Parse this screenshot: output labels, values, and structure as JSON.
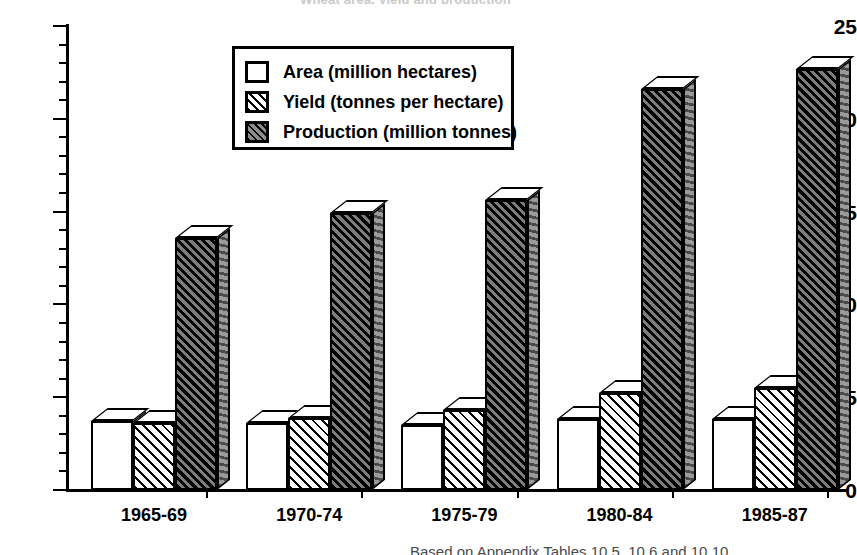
{
  "figure": {
    "title_cropped": "Wheat area, yield and production",
    "caption_cropped": "Based on Appendix Tables 10.5, 10.6 and 10.10"
  },
  "chart_data": {
    "type": "bar",
    "title": "Wheat area, yield and production",
    "xlabel": "",
    "ylabel": "",
    "ylim": [
      0,
      25
    ],
    "yticks": [
      0,
      5,
      10,
      15,
      20,
      25
    ],
    "ytick_labels": [
      "0",
      "5",
      "10",
      "15",
      "20",
      "25"
    ],
    "minor_tick_step": 1,
    "grid": false,
    "legend_position": "upper center",
    "categories": [
      "1965-69",
      "1970-74",
      "1975-79",
      "1980-84",
      "1985-87"
    ],
    "series": [
      {
        "name": "Area (million hectares)",
        "values": [
          3.7,
          3.6,
          3.5,
          3.8,
          3.8
        ]
      },
      {
        "name": "Yield (tonnes per hectare)",
        "values": [
          3.6,
          3.9,
          4.3,
          5.2,
          5.5
        ]
      },
      {
        "name": "Production (million tonnes)",
        "values": [
          13.6,
          14.9,
          15.6,
          21.6,
          22.7
        ]
      }
    ]
  },
  "legend": {
    "items": [
      {
        "label": "Area (million hectares)",
        "swatch": "open-square-swatch"
      },
      {
        "label": "Yield (tonnes per hectare)",
        "swatch": "diagonal-hatch-swatch"
      },
      {
        "label": "Production (million tonnes)",
        "swatch": "dense-hatch-swatch"
      }
    ]
  }
}
